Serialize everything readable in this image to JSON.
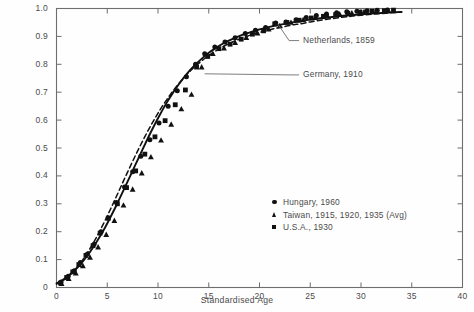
{
  "chart_data": {
    "type": "scatter",
    "title": "",
    "xlabel": "Standardised Age",
    "ylabel": "",
    "xlim": [
      0,
      40
    ],
    "ylim": [
      0,
      1.0
    ],
    "xticks": [
      0,
      5,
      10,
      15,
      20,
      25,
      30,
      35,
      40
    ],
    "xticklabels": [
      "0",
      "5",
      "10",
      "15",
      "20",
      "25",
      "30",
      "35",
      "40"
    ],
    "yticks": [
      0,
      0.1,
      0.2,
      0.3,
      0.4,
      0.5,
      0.6,
      0.7,
      0.8,
      0.9,
      1.0
    ],
    "yticklabels": [
      "0",
      "0.1",
      "0.2",
      "0.3",
      "0.4",
      "0.5",
      "0.6",
      "0.7",
      "0.8",
      "0.9",
      "1.0"
    ],
    "grid": false,
    "legend_position": "lower-right",
    "legend": [
      {
        "marker": "circle",
        "label": "Hungary, 1960"
      },
      {
        "marker": "triangle",
        "label": "Taiwan, 1915, 1920, 1935 (Avg)"
      },
      {
        "marker": "square",
        "label": "U.S.A., 1930"
      }
    ],
    "annotations": [
      {
        "label": "Netherlands, 1859",
        "text_x": 23.9,
        "text_y": 0.885,
        "point_x": 21.8,
        "point_y": 0.945
      },
      {
        "label": "Germany, 1910",
        "text_x": 23.9,
        "text_y": 0.762,
        "point_x": 14.6,
        "point_y": 0.766
      }
    ],
    "series": [
      {
        "name": "Germany, 1910",
        "style": "solid-line",
        "x": [
          0.0,
          0.6,
          1.2,
          1.8,
          2.4,
          3.0,
          3.6,
          4.2,
          4.8,
          5.4,
          6.0,
          6.6,
          7.2,
          7.8,
          8.4,
          9.0,
          9.6,
          10.2,
          10.8,
          11.4,
          12.0,
          12.6,
          13.2,
          13.8,
          14.4,
          15.0,
          15.6,
          16.2,
          16.8,
          17.4,
          18.0,
          18.6,
          19.2,
          19.8,
          20.4,
          21.0,
          21.6,
          22.2,
          22.8,
          23.4,
          24.0,
          25.0,
          26.0,
          27.0,
          28.0,
          29.0,
          30.0,
          31.0,
          32.0,
          33.0,
          34.0
        ],
        "y": [
          0.015,
          0.027,
          0.043,
          0.062,
          0.085,
          0.112,
          0.143,
          0.178,
          0.216,
          0.258,
          0.302,
          0.348,
          0.395,
          0.442,
          0.489,
          0.535,
          0.579,
          0.62,
          0.659,
          0.694,
          0.726,
          0.755,
          0.781,
          0.803,
          0.823,
          0.841,
          0.856,
          0.87,
          0.882,
          0.892,
          0.901,
          0.909,
          0.916,
          0.923,
          0.929,
          0.934,
          0.939,
          0.943,
          0.947,
          0.951,
          0.954,
          0.96,
          0.965,
          0.969,
          0.973,
          0.976,
          0.979,
          0.982,
          0.984,
          0.986,
          0.988
        ]
      },
      {
        "name": "Netherlands, 1859",
        "style": "dashed-line",
        "x": [
          0.0,
          0.6,
          1.2,
          1.8,
          2.4,
          3.0,
          3.6,
          4.2,
          4.8,
          5.4,
          6.0,
          6.6,
          7.2,
          7.8,
          8.4,
          9.0,
          9.6,
          10.2,
          10.8,
          11.4,
          12.0,
          12.6,
          13.2,
          13.8,
          14.4,
          15.0,
          15.6,
          16.2,
          16.8,
          17.4,
          18.0,
          18.6,
          19.2,
          19.8,
          20.4,
          21.0,
          21.6,
          22.2,
          22.8,
          23.4,
          24.0,
          25.0,
          26.0,
          27.0,
          28.0,
          29.0,
          30.0,
          31.0,
          32.0,
          33.0,
          34.0
        ],
        "y": [
          0.012,
          0.024,
          0.041,
          0.063,
          0.09,
          0.122,
          0.158,
          0.198,
          0.241,
          0.287,
          0.334,
          0.382,
          0.429,
          0.475,
          0.519,
          0.561,
          0.6,
          0.637,
          0.67,
          0.701,
          0.729,
          0.754,
          0.777,
          0.797,
          0.815,
          0.832,
          0.846,
          0.859,
          0.871,
          0.881,
          0.89,
          0.898,
          0.906,
          0.912,
          0.918,
          0.924,
          0.929,
          0.933,
          0.938,
          0.942,
          0.945,
          0.952,
          0.958,
          0.963,
          0.968,
          0.972,
          0.976,
          0.979,
          0.982,
          0.985,
          0.987
        ]
      },
      {
        "name": "Hungary, 1960",
        "style": "circle-markers",
        "x": [
          0.45,
          1.15,
          1.75,
          2.35,
          3.05,
          3.7,
          4.4,
          5.1,
          5.9,
          6.7,
          7.5,
          8.3,
          9.2,
          10.1,
          11.0,
          11.9,
          12.8,
          13.7,
          14.6,
          15.6,
          16.6,
          17.6,
          18.6,
          19.6,
          20.6,
          21.6,
          22.6,
          23.6,
          24.6,
          25.6,
          26.6,
          27.6,
          28.6,
          29.6,
          30.6,
          31.6,
          32.6
        ],
        "y": [
          0.02,
          0.04,
          0.06,
          0.09,
          0.12,
          0.155,
          0.2,
          0.25,
          0.305,
          0.36,
          0.415,
          0.47,
          0.53,
          0.59,
          0.65,
          0.705,
          0.755,
          0.8,
          0.838,
          0.862,
          0.88,
          0.895,
          0.91,
          0.922,
          0.932,
          0.948,
          0.952,
          0.96,
          0.968,
          0.975,
          0.98,
          0.985,
          0.988,
          0.99,
          0.992,
          0.994,
          0.995
        ]
      },
      {
        "name": "Taiwan, 1915, 1920, 1935 (Avg)",
        "style": "triangle-markers",
        "x": [
          0.5,
          1.2,
          1.9,
          2.6,
          3.3,
          4.1,
          4.9,
          5.7,
          6.6,
          7.5,
          8.4,
          9.3,
          10.3,
          11.3,
          12.3,
          13.3,
          14.3,
          15.4,
          16.5,
          17.6,
          18.7,
          19.8,
          20.9,
          22.0,
          23.1,
          24.3,
          25.5,
          26.7,
          27.9,
          29.1,
          30.3,
          31.5,
          32.7
        ],
        "y": [
          0.014,
          0.032,
          0.052,
          0.078,
          0.108,
          0.145,
          0.19,
          0.24,
          0.295,
          0.352,
          0.41,
          0.468,
          0.528,
          0.585,
          0.64,
          0.692,
          0.79,
          0.838,
          0.858,
          0.878,
          0.896,
          0.912,
          0.926,
          0.938,
          0.95,
          0.96,
          0.968,
          0.974,
          0.98,
          0.984,
          0.988,
          0.991,
          0.993
        ]
      },
      {
        "name": "U.S.A., 1930",
        "style": "square-markers",
        "x": [
          0.4,
          1.0,
          1.6,
          2.2,
          2.9,
          3.6,
          4.3,
          5.1,
          6.0,
          6.9,
          7.8,
          8.7,
          9.7,
          10.7,
          11.7,
          12.7,
          13.8,
          14.9,
          16.0,
          17.1,
          18.2,
          19.3,
          20.4,
          21.5,
          22.7,
          23.9,
          25.1,
          26.3,
          27.5,
          28.7,
          29.9,
          31.1,
          32.3,
          33.2
        ],
        "y": [
          0.016,
          0.036,
          0.056,
          0.082,
          0.115,
          0.15,
          0.195,
          0.248,
          0.3,
          0.358,
          0.418,
          0.478,
          0.54,
          0.598,
          0.655,
          0.708,
          0.79,
          0.828,
          0.856,
          0.872,
          0.89,
          0.908,
          0.92,
          0.945,
          0.95,
          0.958,
          0.966,
          0.972,
          0.978,
          0.983,
          0.987,
          0.99,
          0.992,
          0.994
        ]
      }
    ]
  },
  "colors": {
    "ink": "#111111",
    "axis": "#6e6e6e",
    "text": "#4a4a4a",
    "background": "#fefefe"
  }
}
